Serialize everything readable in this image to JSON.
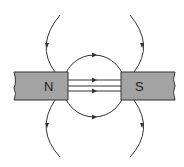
{
  "diagram": {
    "magnets": [
      {
        "label": "N",
        "pole": "north"
      },
      {
        "label": "S",
        "pole": "south"
      }
    ],
    "colors": {
      "magnet_fill": "#a3a3a3",
      "line": "#333333"
    }
  }
}
